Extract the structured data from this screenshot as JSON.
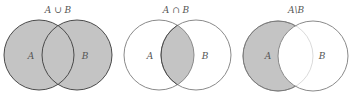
{
  "colors": {
    "fill": "#c4c4c4",
    "stroke_shaded": "#4a4a4a",
    "stroke_plain": "#8a8a8a",
    "background": "#ffffff"
  },
  "diagrams": [
    {
      "title": "A ∪ B",
      "operation": "union",
      "labels": [
        "A",
        "B"
      ]
    },
    {
      "title": "A ∩ B",
      "operation": "intersection",
      "labels": [
        "A",
        "B"
      ]
    },
    {
      "title": "A\\B",
      "operation": "difference",
      "labels": [
        "A",
        "B"
      ]
    }
  ]
}
